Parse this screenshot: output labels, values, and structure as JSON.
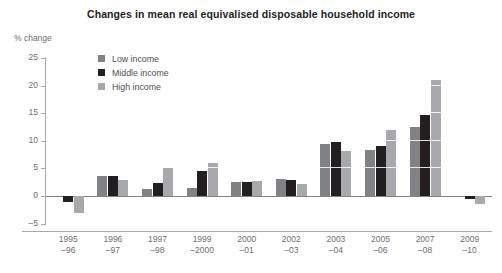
{
  "chart": {
    "title": "Changes in mean real equivalised disposable household income",
    "axis_unit_label": "% change"
  },
  "legend": {
    "position": "top-left-inside",
    "items": [
      {
        "label": "Low income",
        "color": "#808285"
      },
      {
        "label": "Middle income",
        "color": "#231f20"
      },
      {
        "label": "High income",
        "color": "#a7a9ac"
      }
    ]
  },
  "y_axis": {
    "ticks": [
      "25",
      "20",
      "15",
      "10",
      "5",
      "0",
      "-5"
    ]
  },
  "x_axis": {
    "labels": [
      {
        "line1": "1995",
        "line2": "-96"
      },
      {
        "line1": "1996",
        "line2": "-97"
      },
      {
        "line1": "1997",
        "line2": "-98"
      },
      {
        "line1": "1999",
        "line2": "-2000"
      },
      {
        "line1": "2000",
        "line2": "-01"
      },
      {
        "line1": "2002",
        "line2": "-03"
      },
      {
        "line1": "2003",
        "line2": "-04"
      },
      {
        "line1": "2005",
        "line2": "-06"
      },
      {
        "line1": "2007",
        "line2": "-08"
      },
      {
        "line1": "2009",
        "line2": "-10"
      }
    ]
  },
  "chart_data": {
    "type": "bar",
    "title": "Changes in mean real equivalised disposable household income",
    "xlabel": "",
    "ylabel": "% change",
    "ylim": [
      -5,
      25
    ],
    "yticks": [
      -5,
      0,
      5,
      10,
      15,
      20,
      25
    ],
    "grid": false,
    "legend_position": "top-left",
    "categories": [
      "1995-96",
      "1996-97",
      "1997-98",
      "1999-2000",
      "2000-01",
      "2002-03",
      "2003-04",
      "2005-06",
      "2007-08",
      "2009-10"
    ],
    "series": [
      {
        "name": "Low income",
        "color": "#808285",
        "values": [
          0.0,
          3.6,
          1.2,
          1.5,
          2.5,
          3.0,
          9.4,
          8.3,
          12.5,
          0.0
        ]
      },
      {
        "name": "Middle income",
        "color": "#231f20",
        "values": [
          -1.0,
          3.6,
          2.3,
          4.5,
          2.5,
          2.9,
          9.8,
          9.0,
          14.7,
          -0.6
        ]
      },
      {
        "name": "High income",
        "color": "#a7a9ac",
        "values": [
          -3.0,
          2.9,
          5.0,
          6.0,
          2.7,
          2.1,
          8.2,
          12.0,
          21.0,
          -1.4
        ]
      }
    ]
  }
}
